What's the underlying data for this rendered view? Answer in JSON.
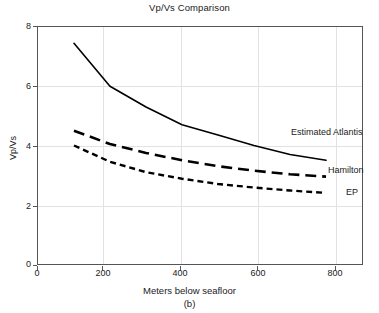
{
  "chart_data": {
    "type": "line",
    "title": "Vp/Vs Comparison",
    "subcaption": "(b)",
    "xlabel": "Meters below seafloor",
    "ylabel": "Vp/Vs",
    "xlim": [
      0,
      900
    ],
    "ylim": [
      0,
      8
    ],
    "xticks": [
      0,
      200,
      400,
      600,
      800
    ],
    "xtick_labels": [
      "0",
      "200",
      "400",
      "600",
      "800"
    ],
    "yticks": [
      0,
      2,
      4,
      6,
      8
    ],
    "ytick_labels": [
      "0",
      "2",
      "4",
      "6",
      "8"
    ],
    "grid": true,
    "legend_position": "inline-right-of-curves",
    "series": [
      {
        "name": "Estimated Atlantis",
        "label": "Estimated Atlantis",
        "style": "solid",
        "color": "#000000",
        "x": [
          100,
          200,
          300,
          400,
          500,
          600,
          700,
          800
        ],
        "y": [
          7.45,
          6.0,
          5.3,
          4.7,
          4.35,
          4.0,
          3.7,
          3.5
        ]
      },
      {
        "name": "Hamilton",
        "label": "Hamilton",
        "style": "dashed",
        "color": "#000000",
        "x": [
          100,
          200,
          300,
          400,
          500,
          600,
          700,
          800
        ],
        "y": [
          4.5,
          4.05,
          3.75,
          3.5,
          3.3,
          3.15,
          3.03,
          2.95
        ]
      },
      {
        "name": "EP",
        "label": "EP",
        "style": "dotted",
        "color": "#000000",
        "x": [
          100,
          200,
          300,
          400,
          500,
          600,
          700,
          800
        ],
        "y": [
          4.0,
          3.45,
          3.1,
          2.88,
          2.7,
          2.58,
          2.48,
          2.4
        ]
      }
    ]
  },
  "chart": {
    "title": "Vp/Vs Comparison",
    "ylabel": "Vp/Vs",
    "xlabel": "Meters below seafloor",
    "subcaption": "(b)",
    "yticks": [
      "8",
      "6",
      "4",
      "2",
      "0"
    ],
    "xticks": [
      "0",
      "200",
      "400",
      "600",
      "800"
    ],
    "labels": {
      "atlantis": "Estimated Atlantis",
      "hamilton": "Hamilton",
      "ep": "EP"
    }
  }
}
